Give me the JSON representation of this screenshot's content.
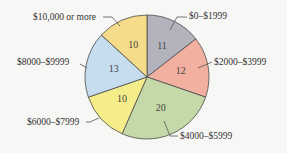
{
  "chart_data": {
    "type": "pie",
    "title": "",
    "categories": [
      "$0–$1999",
      "$2000–$3999",
      "$4000–$5999",
      "$6000–$7999",
      "$8000–$9999",
      "$10,000 or more"
    ],
    "values": [
      11,
      12,
      20,
      10,
      13,
      10
    ],
    "colors": [
      "#b3b3bd",
      "#f2b0a0",
      "#c5d8a8",
      "#f5ec8a",
      "#c6dcef",
      "#f5dc8a"
    ],
    "start_angle": "top (12 o'clock), clockwise",
    "center": [
      147,
      77
    ],
    "radius": 62,
    "labels": [
      {
        "text": "$0–$1999",
        "x": 189,
        "y": 19,
        "anchor": "start",
        "leader": [
          [
            170,
            30
          ],
          [
            177,
            17
          ],
          [
            187,
            17
          ]
        ]
      },
      {
        "text": "$2000–$3999",
        "x": 214,
        "y": 65,
        "anchor": "start",
        "leader": [
          [
            198,
            68
          ],
          [
            212,
            62
          ]
        ]
      },
      {
        "text": "$4000–$5999",
        "x": 180,
        "y": 139,
        "anchor": "start",
        "leader": [
          [
            164,
            121
          ],
          [
            170,
            136
          ],
          [
            178,
            136
          ]
        ]
      },
      {
        "text": "$6000–$7999",
        "x": 27,
        "y": 125,
        "anchor": "start",
        "leader": [
          [
            99,
            118
          ],
          [
            90,
            122
          ],
          [
            86,
            122
          ]
        ]
      },
      {
        "text": "$8000–$9999",
        "x": 17,
        "y": 65,
        "anchor": "start",
        "leader": [
          [
            80,
            64
          ],
          [
            87,
            68
          ]
        ]
      },
      {
        "text": "$10,000 or more",
        "x": 33,
        "y": 20,
        "anchor": "start",
        "leader": [
          [
            103,
            17
          ],
          [
            112,
            17
          ],
          [
            120,
            26
          ]
        ]
      }
    ]
  }
}
